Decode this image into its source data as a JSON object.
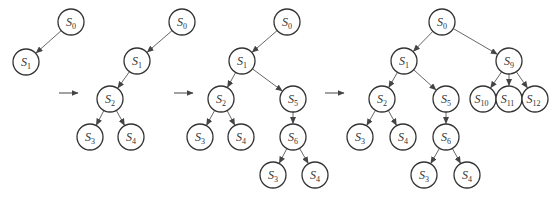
{
  "diagram": {
    "title": "",
    "node_radius": 13,
    "colors": {
      "stroke": "#333333",
      "edge": "#555555",
      "background": "#ffffff"
    },
    "panels": [
      {
        "id": "step-1",
        "nodes": [
          {
            "id": "p1-s0",
            "base": "S",
            "sub": "0",
            "x": 71,
            "y": 22
          },
          {
            "id": "p1-s1",
            "base": "S",
            "sub": "1",
            "x": 26,
            "y": 62
          }
        ],
        "edges": [
          [
            "p1-s0",
            "p1-s1"
          ]
        ]
      },
      {
        "id": "step-2",
        "nodes": [
          {
            "id": "p2-s0",
            "base": "S",
            "sub": "0",
            "x": 182,
            "y": 22
          },
          {
            "id": "p2-s1",
            "base": "S",
            "sub": "1",
            "x": 137,
            "y": 61
          },
          {
            "id": "p2-s2",
            "base": "S",
            "sub": "2",
            "x": 110,
            "y": 99
          },
          {
            "id": "p2-s3",
            "base": "S",
            "sub": "3",
            "x": 90,
            "y": 137
          },
          {
            "id": "p2-s4",
            "base": "S",
            "sub": "4",
            "x": 131,
            "y": 137
          }
        ],
        "edges": [
          [
            "p2-s0",
            "p2-s1"
          ],
          [
            "p2-s1",
            "p2-s2"
          ],
          [
            "p2-s2",
            "p2-s3"
          ],
          [
            "p2-s2",
            "p2-s4"
          ]
        ]
      },
      {
        "id": "step-3",
        "nodes": [
          {
            "id": "p3-s0",
            "base": "S",
            "sub": "0",
            "x": 287,
            "y": 22
          },
          {
            "id": "p3-s1",
            "base": "S",
            "sub": "1",
            "x": 242,
            "y": 61
          },
          {
            "id": "p3-s2",
            "base": "S",
            "sub": "2",
            "x": 221,
            "y": 99
          },
          {
            "id": "p3-s3",
            "base": "S",
            "sub": "3",
            "x": 200,
            "y": 137
          },
          {
            "id": "p3-s4",
            "base": "S",
            "sub": "4",
            "x": 241,
            "y": 137
          },
          {
            "id": "p3-s5",
            "base": "S",
            "sub": "5",
            "x": 293,
            "y": 99
          },
          {
            "id": "p3-s6",
            "base": "S",
            "sub": "6",
            "x": 293,
            "y": 137
          },
          {
            "id": "p3-s3b",
            "base": "S",
            "sub": "3",
            "x": 273,
            "y": 175
          },
          {
            "id": "p3-s4b",
            "base": "S",
            "sub": "4",
            "x": 315,
            "y": 175
          }
        ],
        "edges": [
          [
            "p3-s0",
            "p3-s1"
          ],
          [
            "p3-s1",
            "p3-s2"
          ],
          [
            "p3-s1",
            "p3-s5"
          ],
          [
            "p3-s2",
            "p3-s3"
          ],
          [
            "p3-s2",
            "p3-s4"
          ],
          [
            "p3-s5",
            "p3-s6"
          ],
          [
            "p3-s6",
            "p3-s3b"
          ],
          [
            "p3-s6",
            "p3-s4b"
          ]
        ]
      },
      {
        "id": "step-4",
        "nodes": [
          {
            "id": "p4-s0",
            "base": "S",
            "sub": "0",
            "x": 442,
            "y": 22
          },
          {
            "id": "p4-s1",
            "base": "S",
            "sub": "1",
            "x": 404,
            "y": 61
          },
          {
            "id": "p4-s2",
            "base": "S",
            "sub": "2",
            "x": 382,
            "y": 99
          },
          {
            "id": "p4-s3",
            "base": "S",
            "sub": "3",
            "x": 360,
            "y": 137
          },
          {
            "id": "p4-s4",
            "base": "S",
            "sub": "4",
            "x": 403,
            "y": 137
          },
          {
            "id": "p4-s5",
            "base": "S",
            "sub": "5",
            "x": 446,
            "y": 99
          },
          {
            "id": "p4-s6",
            "base": "S",
            "sub": "6",
            "x": 446,
            "y": 137
          },
          {
            "id": "p4-s3b",
            "base": "S",
            "sub": "3",
            "x": 424,
            "y": 175
          },
          {
            "id": "p4-s4b",
            "base": "S",
            "sub": "4",
            "x": 467,
            "y": 175
          },
          {
            "id": "p4-s9",
            "base": "S",
            "sub": "9",
            "x": 509,
            "y": 61
          },
          {
            "id": "p4-s10",
            "base": "S",
            "sub": "10",
            "x": 483,
            "y": 99
          },
          {
            "id": "p4-s11",
            "base": "S",
            "sub": "11",
            "x": 509,
            "y": 99
          },
          {
            "id": "p4-s12",
            "base": "S",
            "sub": "12",
            "x": 535,
            "y": 99
          }
        ],
        "edges": [
          [
            "p4-s0",
            "p4-s1"
          ],
          [
            "p4-s0",
            "p4-s9"
          ],
          [
            "p4-s1",
            "p4-s2"
          ],
          [
            "p4-s1",
            "p4-s5"
          ],
          [
            "p4-s2",
            "p4-s3"
          ],
          [
            "p4-s2",
            "p4-s4"
          ],
          [
            "p4-s5",
            "p4-s6"
          ],
          [
            "p4-s6",
            "p4-s3b"
          ],
          [
            "p4-s6",
            "p4-s4b"
          ],
          [
            "p4-s9",
            "p4-s10"
          ],
          [
            "p4-s9",
            "p4-s11"
          ],
          [
            "p4-s9",
            "p4-s12"
          ]
        ]
      }
    ],
    "step_arrows": [
      {
        "x1": 59,
        "y1": 93,
        "x2": 78,
        "y2": 93
      },
      {
        "x1": 174,
        "y1": 93,
        "x2": 193,
        "y2": 93
      },
      {
        "x1": 325,
        "y1": 93,
        "x2": 344,
        "y2": 93
      }
    ]
  }
}
